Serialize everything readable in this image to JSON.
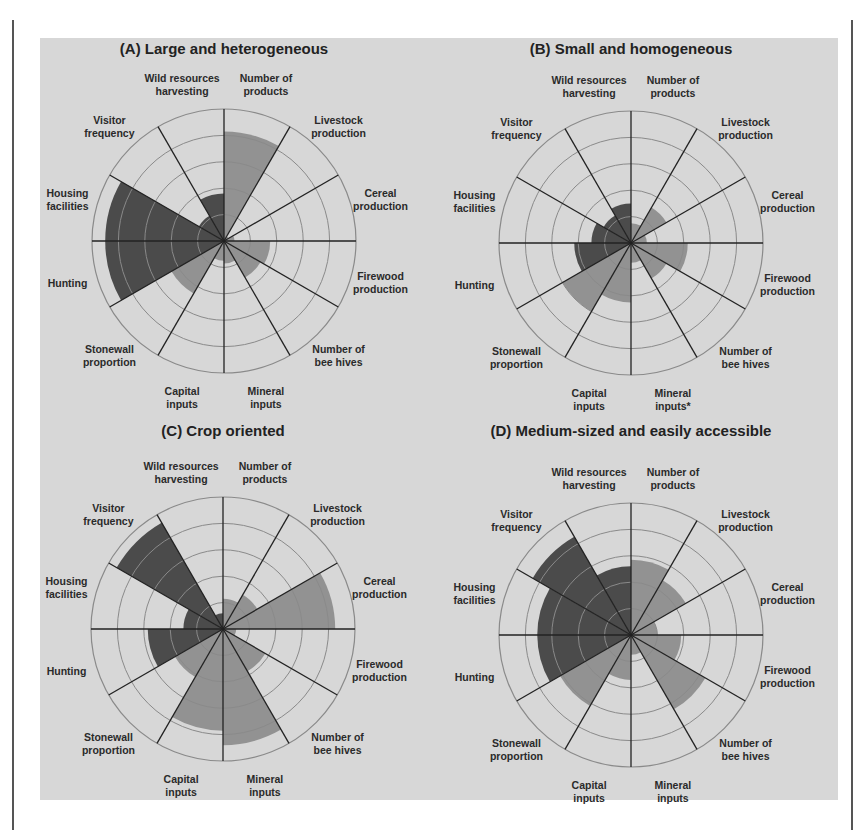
{
  "figure": {
    "panel_colors": {
      "background": "#d7d7d7",
      "ring": "#8a8a8a",
      "spoke": "#222222",
      "dark_fill": "#4b4b4b",
      "light_fill": "#929292"
    }
  },
  "axes": [
    {
      "label_lines": [
        "Number of",
        "products"
      ],
      "fill": "light"
    },
    {
      "label_lines": [
        "Livestock",
        "production"
      ],
      "fill": "light"
    },
    {
      "label_lines": [
        "Cereal",
        "production"
      ],
      "fill": "light"
    },
    {
      "label_lines": [
        "Firewood",
        "production"
      ],
      "fill": "light"
    },
    {
      "label_lines": [
        "Number of",
        "bee hives"
      ],
      "fill": "light"
    },
    {
      "label_lines": [
        "Mineral",
        "inputs"
      ],
      "fill": "light"
    },
    {
      "label_lines": [
        "Capital",
        "inputs"
      ],
      "fill": "light"
    },
    {
      "label_lines": [
        "Stonewall",
        "proportion"
      ],
      "fill": "light"
    },
    {
      "label_lines": [
        "Hunting"
      ],
      "fill": "dark"
    },
    {
      "label_lines": [
        "Housing",
        "facilities"
      ],
      "fill": "dark"
    },
    {
      "label_lines": [
        "Visitor",
        "frequency"
      ],
      "fill": "dark"
    },
    {
      "label_lines": [
        "Wild resources",
        "harvesting"
      ],
      "fill": "dark"
    }
  ],
  "chart_data": [
    {
      "type": "polar-area",
      "title": "(A) Large and heterogeneous",
      "categories": [
        "Number of products",
        "Livestock production",
        "Cereal production",
        "Firewood production",
        "Number of bee hives",
        "Mineral inputs",
        "Capital inputs",
        "Stonewall proportion",
        "Hunting",
        "Housing facilities",
        "Visitor frequency",
        "Wild resources harvesting"
      ],
      "values": [
        0.83,
        0.04,
        0.08,
        0.35,
        0.32,
        0.17,
        0.15,
        0.46,
        0.9,
        0.9,
        0.22,
        0.36
      ],
      "rings": [
        0.2,
        0.4,
        0.6,
        0.8,
        1.0
      ],
      "ylim": [
        0,
        1
      ]
    },
    {
      "type": "polar-area",
      "title": "(B) Small and homogeneous",
      "categories": [
        "Number of products",
        "Livestock production",
        "Cereal production",
        "Firewood production",
        "Number of bee hives",
        "Mineral inputs*",
        "Capital inputs",
        "Stonewall proportion",
        "Hunting",
        "Housing facilities",
        "Visitor frequency",
        "Wild resources harvesting"
      ],
      "values": [
        0.15,
        0.31,
        0.12,
        0.43,
        0.31,
        0.15,
        0.45,
        0.6,
        0.43,
        0.3,
        0.24,
        0.3
      ],
      "rings": [
        0.2,
        0.4,
        0.6,
        0.8,
        1.0
      ],
      "ylim": [
        0,
        1
      ]
    },
    {
      "type": "polar-area",
      "title": "(C) Crop oriented",
      "categories": [
        "Number of products",
        "Livestock production",
        "Cereal production",
        "Firewood production",
        "Number of bee hives",
        "Mineral inputs",
        "Capital inputs",
        "Stonewall proportion",
        "Hunting",
        "Housing facilities",
        "Visitor frequency",
        "Wild resources harvesting"
      ],
      "values": [
        0.23,
        0.3,
        0.85,
        0.1,
        0.37,
        0.88,
        0.77,
        0.42,
        0.57,
        0.3,
        0.93,
        0.12
      ],
      "rings": [
        0.2,
        0.4,
        0.6,
        0.8,
        1.0
      ],
      "ylim": [
        0,
        1
      ]
    },
    {
      "type": "polar-area",
      "title": "(D) Medium-sized and easily accessible",
      "categories": [
        "Number of products",
        "Livestock production",
        "Cereal production",
        "Firewood production",
        "Number of bee hives",
        "Mineral inputs",
        "Capital inputs",
        "Stonewall proportion",
        "Hunting",
        "Housing facilities",
        "Visitor frequency",
        "Wild resources harvesting"
      ],
      "values": [
        0.57,
        0.48,
        0.2,
        0.38,
        0.65,
        0.15,
        0.34,
        0.62,
        0.71,
        0.71,
        0.86,
        0.52
      ],
      "rings": [
        0.2,
        0.4,
        0.6,
        0.8,
        1.0
      ],
      "ylim": [
        0,
        1
      ]
    }
  ],
  "layout": [
    {
      "left": 24,
      "top": 38,
      "cx": 200,
      "cy": 203,
      "title_top": 4
    },
    {
      "left": 431,
      "top": 38,
      "cx": 200,
      "cy": 205,
      "title_top": 4
    },
    {
      "left": 23,
      "top": 420,
      "cx": 200,
      "cy": 209,
      "title_top": 4
    },
    {
      "left": 431,
      "top": 420,
      "cx": 200,
      "cy": 215,
      "title_top": 4
    }
  ]
}
